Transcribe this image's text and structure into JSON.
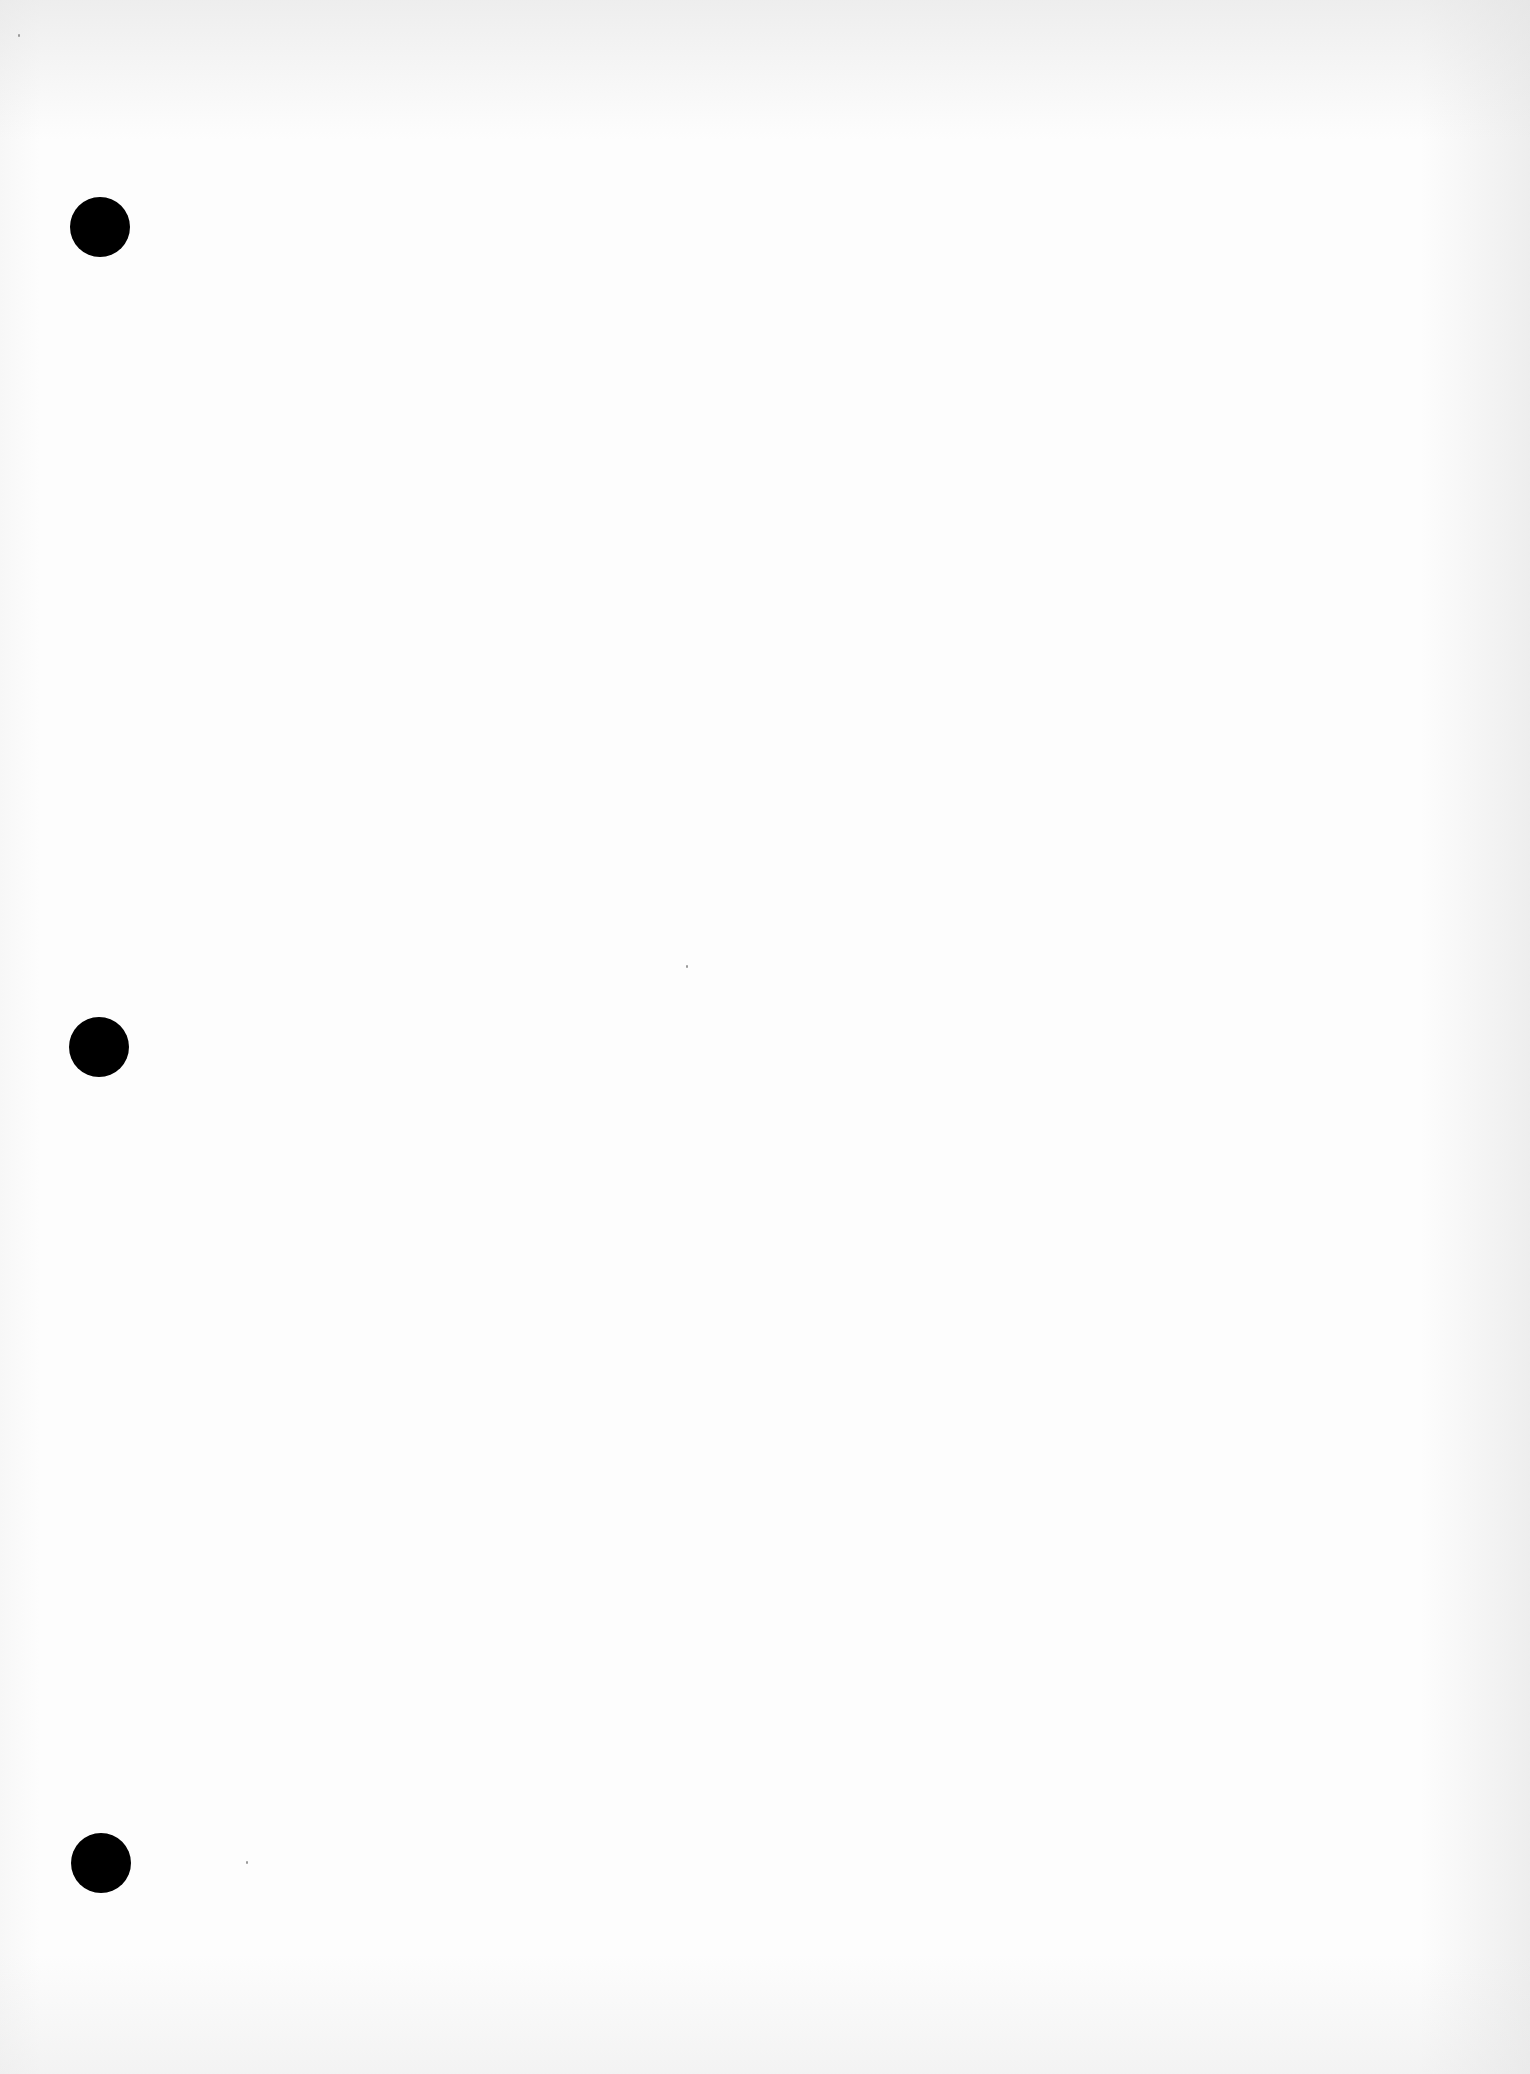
{
  "page": {
    "type": "blank three-hole punched sheet",
    "text": "",
    "background_color": "#fdfdfd",
    "hole_color": "#000000",
    "holes": [
      {
        "id": "top",
        "cx": 100,
        "cy": 228,
        "diameter": 60
      },
      {
        "id": "middle",
        "cx": 100,
        "cy": 1047,
        "diameter": 60
      },
      {
        "id": "bottom",
        "cx": 100,
        "cy": 1864,
        "diameter": 60
      }
    ]
  }
}
